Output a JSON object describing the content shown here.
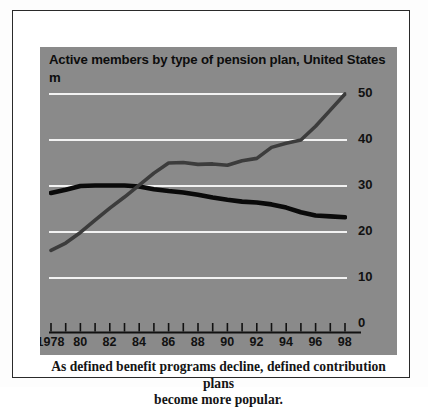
{
  "figure": {
    "title": "Active members by type of pension plan, United States",
    "unit_label": "m",
    "caption_line1": "As defined benefit programs decline, defined contribution plans",
    "caption_line2": "become more popular."
  },
  "colors": {
    "panel_background": "#8a8a8a",
    "page_background": "#ffffff",
    "gridline": "#f2f2f2",
    "defined_benefit_line": "#0a0a0a",
    "defined_contribution_line": "#3c3c3c",
    "axis": "#111111",
    "text": "#0d0d0d"
  },
  "axis": {
    "y_ticks": [
      "50",
      "40",
      "30",
      "20",
      "10",
      "0"
    ],
    "x_labels": [
      "1978",
      "80",
      "82",
      "84",
      "86",
      "88",
      "90",
      "92",
      "94",
      "96",
      "98"
    ]
  },
  "chart_data": {
    "type": "line",
    "title": "Active members by type of pension plan, United States",
    "subtitle": "",
    "xlabel": "",
    "ylabel": "m",
    "ylim": [
      0,
      50
    ],
    "xlim": [
      1978,
      1998
    ],
    "grid": true,
    "gridlines_y": [
      10,
      20,
      30,
      40,
      50
    ],
    "legend_position": "none",
    "x": [
      1978,
      1979,
      1980,
      1981,
      1982,
      1983,
      1984,
      1985,
      1986,
      1987,
      1988,
      1989,
      1990,
      1991,
      1992,
      1993,
      1994,
      1995,
      1996,
      1997,
      1998
    ],
    "x_tick_labels": [
      "1978",
      "80",
      "82",
      "84",
      "86",
      "88",
      "90",
      "92",
      "94",
      "96",
      "98"
    ],
    "series": [
      {
        "name": "Defined benefit",
        "color": "#0a0a0a",
        "values": [
          28.5,
          29.2,
          30.0,
          30.1,
          30.1,
          30.1,
          29.9,
          29.3,
          28.9,
          28.6,
          28.1,
          27.5,
          27.0,
          26.6,
          26.4,
          26.0,
          25.3,
          24.3,
          23.6,
          23.4,
          23.2
        ]
      },
      {
        "name": "Defined contribution",
        "color": "#3c3c3c",
        "values": [
          16.0,
          17.6,
          19.9,
          22.6,
          25.2,
          27.6,
          30.2,
          32.8,
          35.0,
          35.1,
          34.7,
          34.8,
          34.5,
          35.5,
          36.0,
          38.4,
          39.3,
          40.0,
          43.0,
          46.5,
          50.0
        ]
      }
    ],
    "annotations": [
      "Lines cross at approximately 1984 at 30m",
      "Defined contribution overtakes defined benefit after 1984"
    ]
  }
}
